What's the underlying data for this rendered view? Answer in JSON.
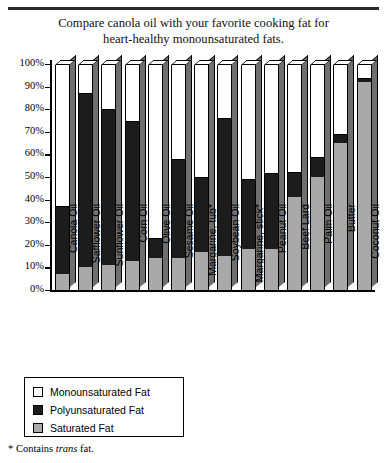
{
  "title": {
    "line1": "Compare canola oil with your favorite cooking fat for",
    "line2": "heart-healthy monounsaturated fats."
  },
  "footnote": {
    "prefix": "* Contains ",
    "italic": "trans",
    "suffix": " fat."
  },
  "legend": {
    "items": [
      {
        "label": "Monounsaturated Fat",
        "color": "#ffffff",
        "key": "mono"
      },
      {
        "label": "Polyunsaturated Fat",
        "color": "#1c1c1c",
        "key": "poly"
      },
      {
        "label": "Saturated Fat",
        "color": "#a9a9a9",
        "key": "sat"
      }
    ]
  },
  "chart_data": {
    "type": "bar",
    "subtype": "stacked-percent-3d",
    "title": "Compare canola oil with your favorite cooking fat for heart-healthy monounsaturated fats.",
    "xlabel": "",
    "ylabel": "",
    "ylim": [
      0,
      100
    ],
    "yticks": [
      "0%",
      "10%",
      "20%",
      "30%",
      "40%",
      "50%",
      "60%",
      "70%",
      "80%",
      "90%",
      "100%"
    ],
    "ytick_values": [
      0,
      10,
      20,
      30,
      40,
      50,
      60,
      70,
      80,
      90,
      100
    ],
    "grid": false,
    "legend_position": "below-left",
    "stack_order_bottom_to_top": [
      "Saturated Fat",
      "Polyunsaturated Fat",
      "Monounsaturated Fat"
    ],
    "categories": [
      "Canola Oil",
      "Safflower Oil",
      "Sunflower Oil",
      "Corn Oil",
      "Olive Oil",
      "Sesame Oil",
      "Margarine, tub*",
      "Soybean Oil",
      "Margarine, stick*",
      "Peanut Oil",
      "Beef Lard",
      "Palm Oil",
      "Butter",
      "Coconut Oil"
    ],
    "series": [
      {
        "name": "Saturated Fat",
        "color": "#a9a9a9",
        "values": [
          7,
          10,
          11,
          13,
          14,
          14,
          17,
          15,
          18,
          18,
          41,
          50,
          65,
          92
        ]
      },
      {
        "name": "Polyunsaturated Fat",
        "color": "#1c1c1c",
        "values": [
          30,
          77,
          69,
          62,
          9,
          44,
          33,
          61,
          31,
          34,
          11,
          9,
          4,
          2
        ]
      },
      {
        "name": "Monounsaturated Fat",
        "color": "#ffffff",
        "values": [
          63,
          13,
          20,
          25,
          77,
          42,
          50,
          24,
          51,
          48,
          48,
          41,
          31,
          6
        ]
      }
    ],
    "annotations": [
      "* Contains trans fat."
    ]
  }
}
